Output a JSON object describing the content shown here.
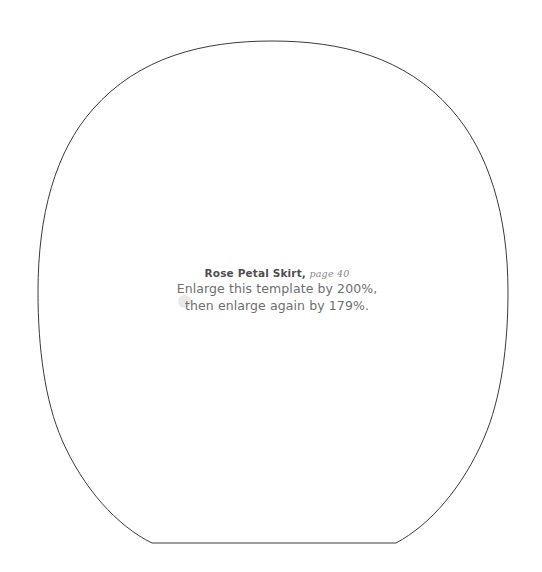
{
  "page": {
    "background_color": "#ffffff",
    "width": 542,
    "height": 572
  },
  "template_shape": {
    "name": "rose-petal-skirt-pattern-outline",
    "description": "Dome / bell shaped sewing pattern piece with a rounded top arc, sides tapering inward near the base, and a flat bottom edge",
    "stroke_color": "#3a3a3a",
    "stroke_width": 1,
    "fill": "none",
    "apex_y": 41,
    "leftmost_x": 38,
    "rightmost_x": 508,
    "bottom_edge_y": 543,
    "bottom_edge_left_x": 152,
    "bottom_edge_right_x": 396
  },
  "note": {
    "bullet": {
      "name": "bullet-dot",
      "color": "#e9e9e9"
    },
    "title_project": "Rose Petal Skirt,",
    "title_page": "page 40",
    "instruction_line_1": "Enlarge this template by 200%,",
    "instruction_line_2": "then enlarge again by 179%.",
    "text_color": "#6e6e6e",
    "title_color": "#4f4f4f"
  }
}
